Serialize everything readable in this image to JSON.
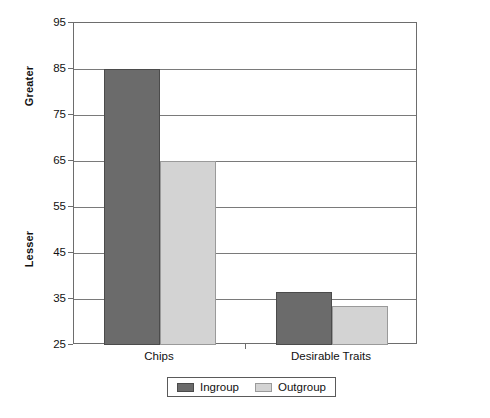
{
  "chart_data": {
    "type": "bar",
    "title": "",
    "subtitle": "",
    "xlabel": "",
    "ylabel_upper": "Greater",
    "ylabel_lower": "Lesser",
    "categories": [
      "Chips",
      "Desirable Traits"
    ],
    "series": [
      {
        "name": "Ingroup",
        "color": "#6b6b6b",
        "values": [
          85,
          36.5
        ]
      },
      {
        "name": "Outgroup",
        "color": "#d3d3d3",
        "values": [
          65,
          33.5
        ]
      }
    ],
    "ylim": [
      25,
      95
    ],
    "ytick_step": 10,
    "yticks": [
      95,
      85,
      75,
      65,
      55,
      45,
      35,
      25
    ],
    "grid": true,
    "grid_axis": "y",
    "legend_position": "bottom",
    "legend_entries": [
      "Ingroup",
      "Outgroup"
    ],
    "plot_background": "#ffffff",
    "frame_color": "#6d6d6d",
    "gridline_color": "#7a7a7a"
  }
}
